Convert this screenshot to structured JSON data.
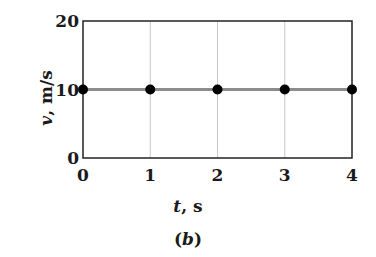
{
  "chart_data": {
    "type": "line",
    "title": "",
    "xlabel": "t, s",
    "ylabel": "v, m/s",
    "caption": "(b)",
    "x": [
      0,
      1,
      2,
      3,
      4
    ],
    "series": [
      {
        "name": "v",
        "values": [
          10,
          10,
          10,
          10,
          10
        ],
        "line_color": "#8c8c8c",
        "marker_color": "#000000"
      }
    ],
    "xlim": [
      0,
      4
    ],
    "ylim": [
      0,
      20
    ],
    "xticks": [
      "0",
      "1",
      "2",
      "3",
      "4"
    ],
    "yticks": [
      "0",
      "10",
      "20"
    ],
    "grid": "vertical",
    "legend": "none"
  },
  "labels": {
    "x_var": "t",
    "x_unit": ", s",
    "y_var": "v",
    "y_unit": ", m/s",
    "caption_open": "(",
    "caption_var": "b",
    "caption_close": ")"
  }
}
